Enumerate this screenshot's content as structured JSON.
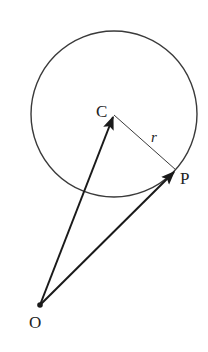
{
  "diagram": {
    "colors": {
      "stroke": "#2a2a2a",
      "background": "#ffffff"
    },
    "circle": {
      "cx": 114,
      "cy": 114,
      "r": 83
    },
    "points": {
      "C": {
        "label": "C",
        "x": 114,
        "y": 115
      },
      "P": {
        "label": "P",
        "x": 176,
        "y": 170
      },
      "O": {
        "label": "O",
        "x": 40,
        "y": 305
      }
    },
    "radius_label": "r",
    "vectors": [
      {
        "from": "O",
        "to": "C",
        "name": "OC"
      },
      {
        "from": "O",
        "to": "P",
        "name": "OP"
      }
    ],
    "segments": [
      {
        "from": "C",
        "to": "P",
        "name": "CP",
        "label": "r"
      }
    ]
  }
}
